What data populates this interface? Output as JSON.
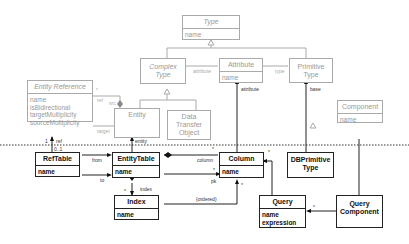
{
  "diagram": {
    "type": "UML class diagram",
    "separator": "dotted horizontal line between conceptual (gray) and database (black) layers",
    "conceptual_classes": [
      {
        "id": "type",
        "name": "Type",
        "attributes": [
          "name"
        ]
      },
      {
        "id": "complex_type",
        "name": "Complex Type",
        "attributes": []
      },
      {
        "id": "attribute",
        "name": "Attribute",
        "attributes": [
          "name"
        ]
      },
      {
        "id": "primitive_type",
        "name": "Primitive Type",
        "attributes": []
      },
      {
        "id": "entity_reference",
        "name": "Entity Reference",
        "attributes": [
          "name",
          "isBidirectional",
          "targetMultiplicity",
          "sourceMultiplicity"
        ]
      },
      {
        "id": "entity",
        "name": "Entity",
        "attributes": []
      },
      {
        "id": "dto",
        "name": "Data Transfer Object",
        "attributes": []
      },
      {
        "id": "component",
        "name": "Component",
        "attributes": [
          "name"
        ]
      }
    ],
    "db_classes": [
      {
        "id": "ref_table",
        "name": "RefTable",
        "attributes": [
          "name"
        ]
      },
      {
        "id": "entity_table",
        "name": "EntityTable",
        "attributes": [
          "name"
        ]
      },
      {
        "id": "column",
        "name": "Column",
        "attributes": [
          "name"
        ]
      },
      {
        "id": "db_primitive_type",
        "name": "DBPrimitive Type",
        "attributes": []
      },
      {
        "id": "index",
        "name": "Index",
        "attributes": [
          "name"
        ]
      },
      {
        "id": "query",
        "name": "Query",
        "attributes": [
          "name",
          "expression"
        ]
      },
      {
        "id": "query_component",
        "name": "Query Component",
        "attributes": []
      }
    ],
    "labels": {
      "attribute_assoc": "attribute",
      "type_assoc": "type",
      "ref": "ref",
      "src": "src",
      "star": "*",
      "target": "target",
      "one": "1",
      "ref_db": "ref",
      "zero_one": "0..1",
      "entity": "entity",
      "attribute_db": "attribute",
      "base": "base",
      "from": "from",
      "to": "to",
      "column": "column",
      "pk": "pk",
      "index": "index",
      "ordered": "{ordered}"
    }
  }
}
